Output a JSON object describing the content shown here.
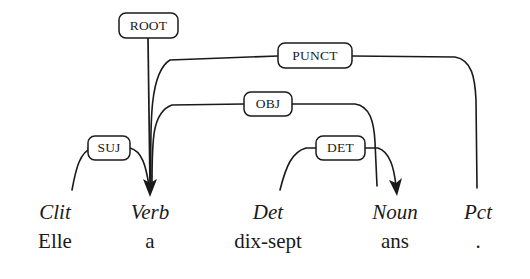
{
  "diagram": {
    "type": "dependency-parse-tree",
    "language": "French",
    "sentence": "Elle a dix-sept ans .",
    "background_color": "#ffffff",
    "line_color": "#1a1a1a",
    "tokens": [
      {
        "id": 1,
        "word": "Elle",
        "pos": "Clit",
        "x": 55
      },
      {
        "id": 2,
        "word": "a",
        "pos": "Verb",
        "x": 150
      },
      {
        "id": 3,
        "word": "dix-sept",
        "pos": "Det",
        "x": 268
      },
      {
        "id": 4,
        "word": "ans",
        "pos": "Noun",
        "x": 395
      },
      {
        "id": 5,
        "word": ".",
        "pos": "Pct",
        "x": 478
      }
    ],
    "root_label": "ROOT",
    "relations": [
      {
        "label": "ROOT",
        "head": "ROOT",
        "dependent": "Verb",
        "label_x": 148,
        "label_y": 25
      },
      {
        "label": "PUNCT",
        "head": "Verb",
        "dependent": "Pct",
        "label_x": 315,
        "label_y": 55
      },
      {
        "label": "OBJ",
        "head": "Verb",
        "dependent": "Noun",
        "label_x": 268,
        "label_y": 104
      },
      {
        "label": "SUJ",
        "head": "Clit",
        "dependent": "Verb",
        "label_x": 109,
        "label_y": 148
      },
      {
        "label": "DET",
        "head": "Det",
        "dependent": "Noun",
        "label_x": 340,
        "label_y": 148
      }
    ]
  }
}
